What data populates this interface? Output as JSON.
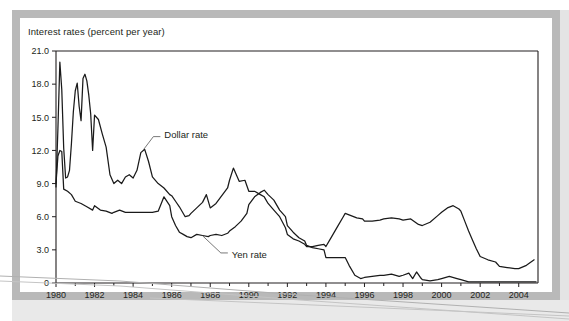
{
  "figure": {
    "title": "Interest rates (percent per year)",
    "background_color": "#ffffff",
    "frame_color": "#b9b9b9",
    "line_color": "#1a1a1a"
  },
  "chart_data": {
    "type": "line",
    "title": "Interest rates (percent per year)",
    "xlabel": "",
    "ylabel": "Interest rates (percent per year)",
    "xlim": [
      1980,
      2005
    ],
    "ylim": [
      0,
      21
    ],
    "yticks": [
      "0",
      "3.0",
      "6.0",
      "9.0",
      "12.0",
      "15.0",
      "18.0",
      "21.0"
    ],
    "ytick_values": [
      0,
      3,
      6,
      9,
      12,
      15,
      18,
      21
    ],
    "xticks": [
      "1980",
      "1982",
      "1984",
      "1986",
      "1988",
      "1990",
      "1992",
      "1994",
      "1996",
      "1998",
      "2000",
      "2002",
      "2004"
    ],
    "xtick_values": [
      1980,
      1982,
      1984,
      1986,
      1988,
      1990,
      1992,
      1994,
      1996,
      1998,
      2000,
      2002,
      2004
    ],
    "grid": false,
    "legend_position": "inline-annotation",
    "annotations": [
      {
        "label": "Dollar rate",
        "x": 1985.1,
        "y": 13.4
      },
      {
        "label": "Yen rate",
        "x": 1988.6,
        "y": 2.55
      }
    ],
    "series": [
      {
        "name": "Dollar rate",
        "x": [
          1980.0,
          1980.1,
          1980.2,
          1980.3,
          1980.4,
          1980.5,
          1980.6,
          1980.7,
          1980.8,
          1980.9,
          1981.0,
          1981.1,
          1981.2,
          1981.3,
          1981.4,
          1981.5,
          1981.6,
          1981.7,
          1981.8,
          1981.9,
          1982.0,
          1982.2,
          1982.4,
          1982.6,
          1982.8,
          1983.0,
          1983.2,
          1983.4,
          1983.6,
          1983.8,
          1984.0,
          1984.2,
          1984.4,
          1984.6,
          1984.8,
          1985.0,
          1985.3,
          1985.6,
          1985.9,
          1986.0,
          1986.2,
          1986.4,
          1986.7,
          1986.9,
          1987.0,
          1987.3,
          1987.6,
          1987.8,
          1988.0,
          1988.3,
          1988.6,
          1988.9,
          1989.0,
          1989.2,
          1989.5,
          1989.8,
          1990.0,
          1990.3,
          1990.6,
          1990.8,
          1991.0,
          1991.3,
          1991.6,
          1991.9,
          1992.0,
          1992.3,
          1992.6,
          1992.9,
          1993.0,
          1993.3,
          1993.6,
          1993.9,
          1994.0,
          1994.3,
          1994.6,
          1994.9,
          1995.0,
          1995.3,
          1995.6,
          1995.9,
          1996.0,
          1996.4,
          1996.8,
          1997.0,
          1997.4,
          1997.8,
          1998.0,
          1998.4,
          1998.8,
          1999.0,
          1999.4,
          1999.8,
          2000.0,
          2000.3,
          2000.6,
          2000.9,
          2001.0,
          2001.2,
          2001.4,
          2001.6,
          2001.8,
          2002.0,
          2002.4,
          2002.8,
          2003.0,
          2003.4,
          2003.8,
          2004.0,
          2004.4,
          2004.8
        ],
        "y": [
          8.7,
          14.0,
          20.0,
          17.5,
          12.2,
          9.5,
          9.6,
          10.2,
          12.6,
          15.5,
          17.4,
          18.1,
          16.0,
          14.7,
          18.5,
          18.9,
          18.3,
          17.0,
          15.3,
          12.0,
          15.2,
          14.8,
          13.5,
          12.3,
          9.8,
          9.0,
          9.3,
          9.0,
          9.6,
          9.8,
          9.5,
          10.2,
          11.8,
          12.1,
          11.0,
          9.6,
          9.0,
          8.6,
          8.0,
          7.9,
          7.4,
          6.9,
          6.0,
          6.1,
          6.3,
          6.8,
          7.3,
          8.0,
          6.8,
          7.2,
          7.9,
          8.6,
          9.3,
          10.4,
          9.2,
          9.3,
          8.3,
          8.3,
          8.0,
          7.8,
          7.2,
          6.6,
          6.0,
          5.0,
          4.4,
          4.0,
          3.8,
          3.5,
          3.3,
          3.3,
          3.4,
          3.5,
          3.3,
          4.2,
          5.1,
          6.0,
          6.3,
          6.1,
          5.9,
          5.8,
          5.6,
          5.6,
          5.7,
          5.8,
          5.9,
          5.8,
          5.7,
          5.8,
          5.3,
          5.2,
          5.5,
          6.1,
          6.4,
          6.8,
          7.0,
          6.7,
          6.5,
          5.6,
          4.7,
          3.9,
          3.1,
          2.4,
          2.1,
          1.9,
          1.5,
          1.4,
          1.3,
          1.3,
          1.6,
          2.1
        ]
      },
      {
        "name": "Yen rate",
        "x": [
          1980.0,
          1980.1,
          1980.2,
          1980.3,
          1980.4,
          1980.6,
          1980.8,
          1981.0,
          1981.3,
          1981.6,
          1981.9,
          1982.0,
          1982.3,
          1982.6,
          1982.9,
          1983.0,
          1983.3,
          1983.6,
          1983.9,
          1984.0,
          1984.3,
          1984.6,
          1984.9,
          1985.0,
          1985.3,
          1985.6,
          1985.9,
          1986.0,
          1986.2,
          1986.4,
          1986.6,
          1986.8,
          1987.0,
          1987.3,
          1987.6,
          1987.9,
          1988.0,
          1988.3,
          1988.6,
          1988.9,
          1989.0,
          1989.3,
          1989.6,
          1989.9,
          1990.0,
          1990.3,
          1990.6,
          1990.8,
          1991.0,
          1991.3,
          1991.6,
          1991.9,
          1992.0,
          1992.3,
          1992.6,
          1992.9,
          1993.0,
          1993.3,
          1993.6,
          1993.9,
          1994.0,
          1994.3,
          1994.6,
          1994.9,
          1995.0,
          1995.2,
          1995.5,
          1995.8,
          1996.0,
          1996.4,
          1996.8,
          1997.0,
          1997.4,
          1997.8,
          1998.0,
          1998.3,
          1998.5,
          1998.7,
          1998.9,
          1999.0,
          1999.4,
          1999.8,
          2000.0,
          2000.4,
          2000.8,
          2001.0,
          2001.4,
          2001.8,
          2002.0,
          2002.5,
          2003.0,
          2003.5,
          2004.0,
          2004.5,
          2004.9
        ],
        "y": [
          9.0,
          11.5,
          12.0,
          11.9,
          8.5,
          8.3,
          8.0,
          7.4,
          7.2,
          6.9,
          6.6,
          7.0,
          6.6,
          6.5,
          6.3,
          6.4,
          6.6,
          6.4,
          6.4,
          6.4,
          6.4,
          6.4,
          6.4,
          6.4,
          6.5,
          7.8,
          7.0,
          6.0,
          5.2,
          4.6,
          4.4,
          4.2,
          4.1,
          4.4,
          4.3,
          4.2,
          4.3,
          4.4,
          4.3,
          4.5,
          4.7,
          5.1,
          5.6,
          6.3,
          7.1,
          7.8,
          8.2,
          8.4,
          8.0,
          7.5,
          6.6,
          6.0,
          5.2,
          4.6,
          4.1,
          3.8,
          3.4,
          3.2,
          3.1,
          3.0,
          2.3,
          2.3,
          2.3,
          2.3,
          2.3,
          1.6,
          0.7,
          0.4,
          0.5,
          0.6,
          0.7,
          0.7,
          0.8,
          0.6,
          0.7,
          0.9,
          0.4,
          1.0,
          0.5,
          0.3,
          0.2,
          0.3,
          0.4,
          0.6,
          0.4,
          0.3,
          0.1,
          0.1,
          0.1,
          0.1,
          0.1,
          0.1,
          0.1,
          0.1,
          0.1
        ]
      }
    ]
  }
}
